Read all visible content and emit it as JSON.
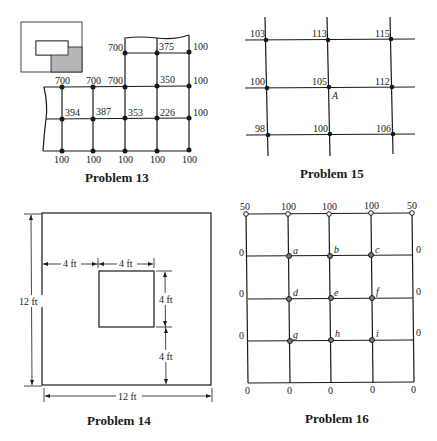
{
  "problems": {
    "p13": {
      "caption": "Problem 13",
      "inset_icon": "region-location-icon",
      "top_row_labels": [
        "700",
        "375",
        "100"
      ],
      "row2_labels": [
        "700",
        "700",
        "700",
        "350",
        "100"
      ],
      "row3_labels": [
        "394",
        "387",
        "353",
        "226",
        "100"
      ],
      "bottom_labels": [
        "100",
        "100",
        "100",
        "100",
        "100"
      ]
    },
    "p15": {
      "caption": "Problem 15",
      "grid": [
        [
          "103",
          "113",
          "115"
        ],
        [
          "100",
          "105",
          "112"
        ],
        [
          "98",
          "100",
          "106"
        ]
      ],
      "point_label": "A"
    },
    "p14": {
      "caption": "Problem 14",
      "outer_width": "12 ft",
      "outer_height": "12 ft",
      "left_offset": "4 ft",
      "inner_width": "4 ft",
      "inner_height": "4 ft",
      "bottom_offset": "4 ft"
    },
    "p16": {
      "caption": "Problem 16",
      "top_labels": [
        "50",
        "100",
        "100",
        "100",
        "50"
      ],
      "left_labels": [
        "0",
        "0",
        "0"
      ],
      "right_labels": [
        "0",
        "0",
        "0"
      ],
      "bottom_labels": [
        "0",
        "0",
        "0",
        "0",
        "0"
      ],
      "node_labels": [
        [
          "a",
          "b",
          "c"
        ],
        [
          "d",
          "e",
          "f"
        ],
        [
          "g",
          "h",
          "i"
        ]
      ]
    }
  }
}
